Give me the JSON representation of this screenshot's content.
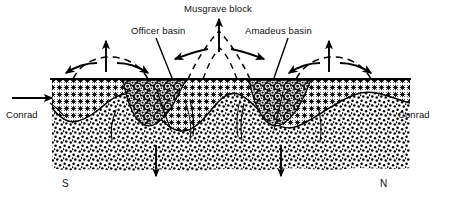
{
  "figure": {
    "type": "geological-cross-section",
    "title_visible": false,
    "background_color": "#ffffff",
    "line_color": "#000000",
    "width_px": 449,
    "height_px": 203
  },
  "labels": {
    "musgrave_block": "Musgrave block",
    "officer_basin": "Officer basin",
    "amadeus_basin": "Amadeus basin",
    "conrad_left": "Conrad",
    "conrad_right": "Conrad",
    "compass_south": "S",
    "compass_north": "N"
  },
  "features": {
    "surface_line": "horizontal ground surface",
    "upper_layer_pattern": "asterisk-crosshatch crust",
    "lower_layer_pattern": "coarse stipple basement",
    "basin_fill_pattern": "dark conglomerate wedge",
    "conrad_discontinuity": "wavy boundary between upper and lower layers",
    "uplift_arrows": "vertical up arrows over flank domes and central block",
    "spreading_arrows": "curved diverging arrows at domes",
    "subsidence_arrows": "vertical down arrows beneath basins",
    "dashed_arches": "dashed dome and inverted-v uplift traces"
  },
  "colors": {
    "ink": "#000000",
    "paper": "#ffffff",
    "basin_fill": "#1a1a1a",
    "crust_tone": "#2b2b2b"
  }
}
